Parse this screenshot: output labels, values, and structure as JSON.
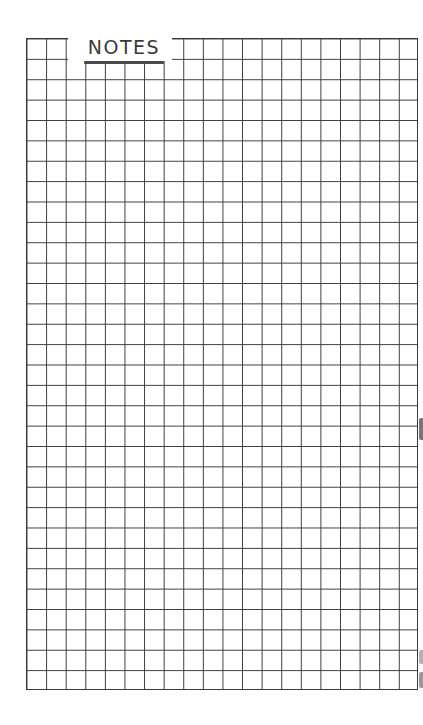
{
  "page": {
    "title": "NOTES",
    "type": "graph-paper-notes-sheet"
  },
  "grid": {
    "columns": 20,
    "rows": 32,
    "line_color": "#3d3d3d",
    "background_color": "#ffffff"
  },
  "colors": {
    "ink": "#3a3a3a",
    "paper": "#ffffff"
  }
}
